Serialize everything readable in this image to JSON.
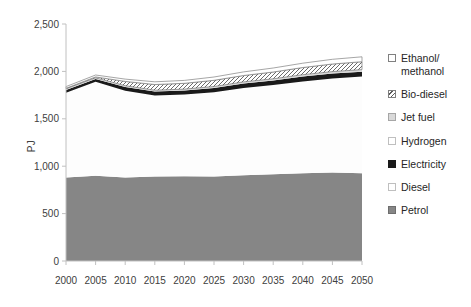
{
  "chart_data": {
    "type": "area",
    "stacked": true,
    "title": "",
    "ylabel": "PJ",
    "ylim": [
      0,
      2500
    ],
    "grid": false,
    "y_ticks": [
      {
        "value": 0,
        "label": "0"
      },
      {
        "value": 500,
        "label": "500"
      },
      {
        "value": 1000,
        "label": "1,000"
      },
      {
        "value": 1500,
        "label": "1,500"
      },
      {
        "value": 2000,
        "label": "2,000"
      },
      {
        "value": 2500,
        "label": "2,500"
      }
    ],
    "x": [
      2000,
      2005,
      2010,
      2015,
      2020,
      2025,
      2030,
      2035,
      2040,
      2045,
      2050
    ],
    "series": [
      {
        "name": "Petrol",
        "values": [
          880,
          900,
          880,
          890,
          895,
          890,
          905,
          915,
          925,
          935,
          925
        ],
        "fill": "#868686"
      },
      {
        "name": "Diesel",
        "values": [
          895,
          990,
          915,
          855,
          860,
          890,
          920,
          940,
          970,
          990,
          1020
        ],
        "fill": "#fdfdfd"
      },
      {
        "name": "Electricity",
        "values": [
          30,
          30,
          40,
          42,
          42,
          44,
          46,
          48,
          50,
          52,
          52
        ],
        "fill": "#1a1a1a"
      },
      {
        "name": "Hydrogen",
        "values": [
          0,
          0,
          0,
          0,
          0,
          0,
          0,
          0,
          0,
          0,
          0
        ],
        "fill": "#ffffff"
      },
      {
        "name": "Jet fuel",
        "values": [
          12,
          12,
          14,
          15,
          16,
          17,
          18,
          19,
          20,
          21,
          22
        ],
        "fill": "#d9d9d9"
      },
      {
        "name": "Bio-diesel",
        "values": [
          5,
          10,
          45,
          60,
          62,
          65,
          68,
          72,
          76,
          80,
          83
        ],
        "fill": "hatch",
        "stroke": "#737373"
      },
      {
        "name": "Ethanol/methanol",
        "values": [
          18,
          20,
          25,
          28,
          30,
          35,
          38,
          42,
          46,
          50,
          52
        ],
        "fill": "#ffffff",
        "stroke": "#808080"
      }
    ],
    "legend": {
      "position": "right",
      "items": [
        {
          "label": "Ethanol/methanol",
          "fill": "#ffffff",
          "border": "#808080",
          "hatch": false
        },
        {
          "label": "Bio-diesel",
          "fill": "#ffffff",
          "border": "#808080",
          "hatch": true
        },
        {
          "label": "Jet fuel",
          "fill": "#d9d9d9",
          "border": "#a6a6a6",
          "hatch": false
        },
        {
          "label": "Hydrogen",
          "fill": "#ffffff",
          "border": "#bfbfbf",
          "hatch": false
        },
        {
          "label": "Electricity",
          "fill": "#1a1a1a",
          "border": "#1a1a1a",
          "hatch": false
        },
        {
          "label": "Diesel",
          "fill": "#ffffff",
          "border": "#bfbfbf",
          "hatch": false
        },
        {
          "label": "Petrol",
          "fill": "#868686",
          "border": "#6e6e6e",
          "hatch": false
        }
      ]
    },
    "colors": {
      "axis_line": "#c0c0c0",
      "tick_text": "#404040",
      "hatch_line": "#5a5a5a"
    }
  }
}
